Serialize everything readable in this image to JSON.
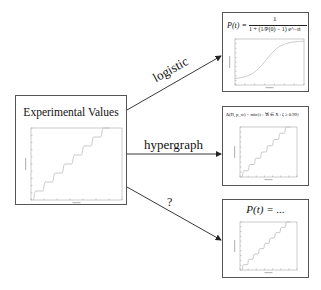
{
  "source": {
    "title": "Experimental Values",
    "plot": {
      "type": "staircase",
      "steps": 8,
      "xlabel": "Time Steps",
      "ylabel": "Nodes Activated"
    }
  },
  "arrows": [
    {
      "label": "logistic",
      "target": "logistic-model"
    },
    {
      "label": "hypergraph",
      "target": "hypergraph-model"
    },
    {
      "label": "?",
      "target": "unknown-model"
    }
  ],
  "targets": [
    {
      "id": "logistic-model",
      "formula_lhs": "P(t) =",
      "formula_num": "1",
      "formula_den": "1 + (1/P(0) − 1) e^−rt",
      "plot": {
        "type": "sigmoid"
      }
    },
    {
      "id": "hypergraph-model",
      "formula": "Δ(Π, p_w) = min{t : ∀i ∈ X : ζ ≥ 0.99}",
      "plot": {
        "type": "staircase",
        "steps": 8
      }
    },
    {
      "id": "unknown-model",
      "formula": "P(t) = ...",
      "plot": {
        "type": "staircase",
        "steps": 9
      }
    }
  ],
  "colors": {
    "border": "#555555",
    "arrow": "#222222",
    "plot_line": "#bbbbbb",
    "axis": "#999999"
  }
}
